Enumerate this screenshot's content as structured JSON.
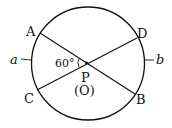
{
  "diagram": {
    "type": "geometry-circle-chords",
    "colors": {
      "stroke": "#111111",
      "background": "#ffffff"
    },
    "circle": {
      "center_label": "(O)",
      "cx": 88,
      "cy": 63.5,
      "r": 56.5
    },
    "intersection": {
      "label": "P"
    },
    "points": {
      "A": {
        "label": "A"
      },
      "B": {
        "label": "B"
      },
      "C": {
        "label": "C"
      },
      "D": {
        "label": "D"
      }
    },
    "chords": [
      {
        "name": "AB",
        "from": "A",
        "to": "B"
      },
      {
        "name": "CD",
        "from": "C",
        "to": "D"
      }
    ],
    "angle": {
      "label": "60°",
      "between": [
        "PA",
        "PC"
      ]
    },
    "arcs": {
      "a": {
        "label": "a"
      },
      "b": {
        "label": "b"
      }
    }
  }
}
